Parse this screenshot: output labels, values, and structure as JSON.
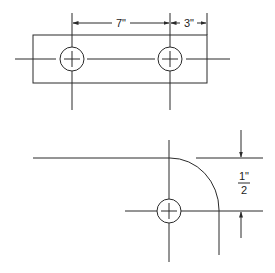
{
  "diagram": {
    "type": "engineering-drawing",
    "top_figure": {
      "description": "Rectangular plate with two holes",
      "dimensions": [
        {
          "label": "7\"",
          "meaning": "distance between hole centers"
        },
        {
          "label": "3\"",
          "meaning": "distance from right hole center to plate edge"
        }
      ]
    },
    "bottom_figure": {
      "description": "Rounded corner with hole at arc center",
      "dimension": {
        "numerator": "1\"",
        "denominator": "2",
        "meaning": "corner radius / offset"
      }
    },
    "colors": {
      "line": "#2a2a2a",
      "background": "#ffffff"
    }
  },
  "labels": {
    "dim_7": "7\"",
    "dim_3": "3\"",
    "frac_num": "1\"",
    "frac_den": "2"
  }
}
